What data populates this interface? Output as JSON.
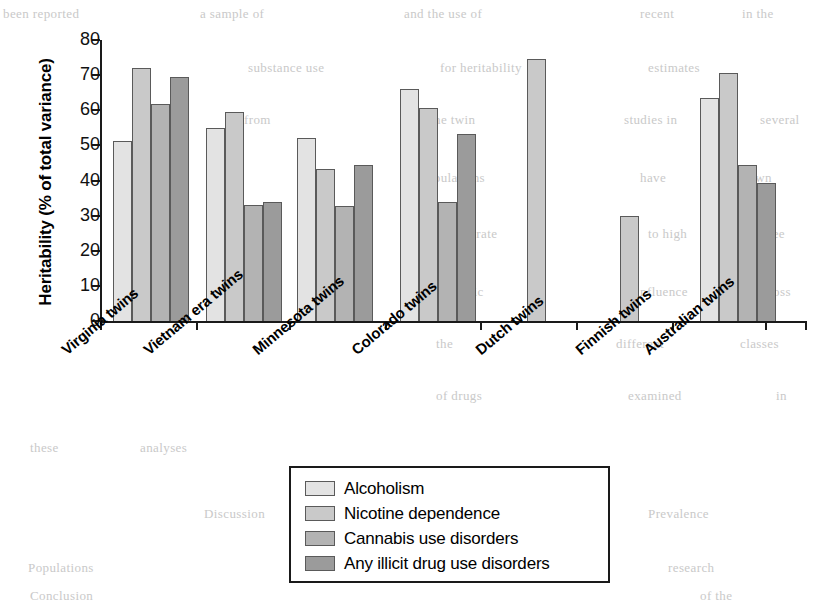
{
  "chart_data": {
    "type": "bar",
    "title": "",
    "xlabel": "",
    "ylabel": "Heritability (% of total variance)",
    "ylim": [
      0,
      80
    ],
    "ytick_labels": [
      "80",
      "70",
      "60",
      "50",
      "40",
      "30",
      "20",
      "10",
      "0"
    ],
    "yticks": [
      80,
      70,
      60,
      50,
      40,
      30,
      20,
      10,
      0
    ],
    "grid": false,
    "legend_position": "bottom-center",
    "categories": [
      "Virginia twins",
      "Vietnam era twins",
      "Minnesota twins",
      "Colorado twins",
      "Dutch twins",
      "Finnish twins",
      "Australian twins"
    ],
    "series": [
      {
        "name": "Alcoholism",
        "color": "#e3e3e3",
        "values": [
          51.3,
          55.0,
          52.2,
          66.0,
          null,
          null,
          63.5
        ]
      },
      {
        "name": "Nicotine dependence",
        "color": "#c9c9c9",
        "values": [
          72.0,
          59.6,
          43.4,
          60.7,
          74.6,
          29.8,
          70.6
        ]
      },
      {
        "name": "Cannabis use disorders",
        "color": "#b3b3b3",
        "values": [
          61.8,
          32.9,
          32.6,
          33.8,
          null,
          null,
          44.5
        ]
      },
      {
        "name": "Any illicit drug use disorders",
        "color": "#9b9b9b",
        "values": [
          69.5,
          33.8,
          44.5,
          53.3,
          null,
          null,
          39.4
        ]
      }
    ]
  },
  "axis": {
    "y_title": "Heritability (% of total variance)"
  },
  "legend": {
    "items": [
      {
        "label": "Alcoholism",
        "color": "#e3e3e3"
      },
      {
        "label": "Nicotine dependence",
        "color": "#c9c9c9"
      },
      {
        "label": "Cannabis use disorders",
        "color": "#b3b3b3"
      },
      {
        "label": "Any illicit drug use disorders",
        "color": "#9b9b9b"
      }
    ]
  },
  "background_text": [
    {
      "text": "been reported",
      "x": 3,
      "y": 6
    },
    {
      "text": "a sample of",
      "x": 200,
      "y": 6
    },
    {
      "text": "and the use of",
      "x": 404,
      "y": 6
    },
    {
      "text": "recent",
      "x": 640,
      "y": 6
    },
    {
      "text": "in the",
      "x": 742,
      "y": 6
    },
    {
      "text": "substance use",
      "x": 248,
      "y": 60
    },
    {
      "text": "for heritability",
      "x": 440,
      "y": 60
    },
    {
      "text": "estimates",
      "x": 648,
      "y": 60
    },
    {
      "text": "from",
      "x": 244,
      "y": 112
    },
    {
      "text": "the twin",
      "x": 430,
      "y": 112
    },
    {
      "text": "studies in",
      "x": 624,
      "y": 112
    },
    {
      "text": "several",
      "x": 760,
      "y": 112
    },
    {
      "text": "populations",
      "x": 420,
      "y": 170
    },
    {
      "text": "have",
      "x": 640,
      "y": 170
    },
    {
      "text": "shown",
      "x": 736,
      "y": 170
    },
    {
      "text": "a moderate",
      "x": 436,
      "y": 226
    },
    {
      "text": "to high",
      "x": 648,
      "y": 226
    },
    {
      "text": "degree",
      "x": 748,
      "y": 226
    },
    {
      "text": "of genetic",
      "x": 428,
      "y": 284
    },
    {
      "text": "influence",
      "x": 636,
      "y": 284
    },
    {
      "text": "across",
      "x": 756,
      "y": 284
    },
    {
      "text": "the",
      "x": 436,
      "y": 336
    },
    {
      "text": "different",
      "x": 616,
      "y": 336
    },
    {
      "text": "classes",
      "x": 740,
      "y": 336
    },
    {
      "text": "of drugs",
      "x": 436,
      "y": 388
    },
    {
      "text": "examined",
      "x": 628,
      "y": 388
    },
    {
      "text": "in",
      "x": 776,
      "y": 388
    },
    {
      "text": "these",
      "x": 30,
      "y": 440
    },
    {
      "text": "analyses",
      "x": 140,
      "y": 440
    },
    {
      "text": "Discussion",
      "x": 204,
      "y": 506
    },
    {
      "text": "Populations",
      "x": 28,
      "y": 560
    },
    {
      "text": "Conclusion",
      "x": 30,
      "y": 588
    },
    {
      "text": "Prevalence",
      "x": 648,
      "y": 506
    },
    {
      "text": "research",
      "x": 668,
      "y": 560
    },
    {
      "text": "of the",
      "x": 700,
      "y": 588
    }
  ]
}
